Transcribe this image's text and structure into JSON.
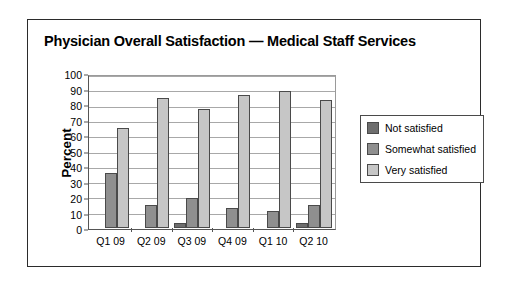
{
  "chart_data": {
    "type": "bar",
    "title": "Physician Overall Satisfaction — Medical Staff Services",
    "xlabel": "",
    "ylabel": "Percent",
    "ylim": [
      0,
      100
    ],
    "ytick_step": 10,
    "yticks": [
      100,
      90,
      80,
      70,
      60,
      50,
      40,
      30,
      20,
      10,
      0
    ],
    "grid": true,
    "legend_position": "right",
    "categories": [
      "Q1 09",
      "Q2 09",
      "Q3 09",
      "Q4 09",
      "Q1 10",
      "Q2 10"
    ],
    "series": [
      {
        "name": "Not satisfied",
        "color": "#6e6e6e",
        "values": [
          0,
          0,
          3,
          0,
          0,
          3
        ]
      },
      {
        "name": "Somewhat satisfied",
        "color": "#8f8f8f",
        "values": [
          36,
          15,
          20,
          13,
          11,
          15
        ]
      },
      {
        "name": "Very satisfied",
        "color": "#c6c6c6",
        "values": [
          66,
          86,
          79,
          88,
          91,
          85
        ]
      }
    ]
  }
}
